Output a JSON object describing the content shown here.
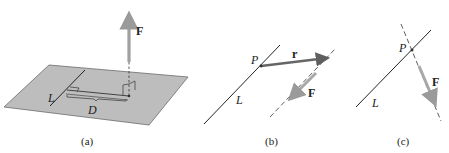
{
  "figure": {
    "panels": [
      {
        "id": "a",
        "caption": "(a)",
        "labels": {
          "line": "L",
          "distance": "D",
          "force": "F"
        }
      },
      {
        "id": "b",
        "caption": "(b)",
        "labels": {
          "point": "P",
          "position_vector": "r",
          "line": "L",
          "force": "F"
        }
      },
      {
        "id": "c",
        "caption": "(c)",
        "labels": {
          "point": "P",
          "line": "L",
          "force": "F"
        }
      }
    ]
  },
  "colors": {
    "plane_fill": "#bdbdbd",
    "plane_edge": "#6b6b6b",
    "force_arrow": "#a0a0a0",
    "position_arrow": "#666666",
    "line": "#222222"
  }
}
